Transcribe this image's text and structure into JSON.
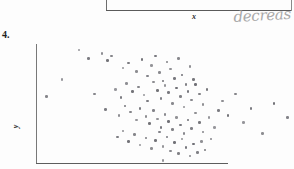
{
  "document": {
    "type": "scanned-worksheet",
    "background_color": "#fdfdfd"
  },
  "previous_figure": {
    "xlabel": "x",
    "axis_color": "#5a5a5a"
  },
  "annotation": {
    "text": "decreas",
    "style": "handwritten",
    "color": "#9a9a9a"
  },
  "question": {
    "number": "4."
  },
  "chart_data": {
    "type": "scatter",
    "title": "",
    "xlabel": "",
    "ylabel": "y",
    "xlim": [
      0,
      100
    ],
    "ylim": [
      0,
      100
    ],
    "grid": false,
    "legend": false,
    "point_color": "#6e6e74",
    "point_size": 2.6,
    "n_points": 103,
    "points": [
      [
        22,
        95
      ],
      [
        27,
        88
      ],
      [
        34,
        92
      ],
      [
        37,
        86
      ],
      [
        39,
        90
      ],
      [
        45,
        80
      ],
      [
        48,
        84
      ],
      [
        52,
        77
      ],
      [
        55,
        87
      ],
      [
        58,
        73
      ],
      [
        60,
        82
      ],
      [
        62,
        90
      ],
      [
        64,
        76
      ],
      [
        66,
        69
      ],
      [
        68,
        85
      ],
      [
        70,
        79
      ],
      [
        72,
        71
      ],
      [
        74,
        88
      ],
      [
        76,
        74
      ],
      [
        78,
        66
      ],
      [
        80,
        81
      ],
      [
        82,
        70
      ],
      [
        30,
        58
      ],
      [
        41,
        62
      ],
      [
        44,
        55
      ],
      [
        47,
        67
      ],
      [
        50,
        60
      ],
      [
        53,
        64
      ],
      [
        56,
        57
      ],
      [
        58,
        52
      ],
      [
        61,
        68
      ],
      [
        63,
        61
      ],
      [
        65,
        54
      ],
      [
        67,
        65
      ],
      [
        69,
        59
      ],
      [
        71,
        50
      ],
      [
        73,
        63
      ],
      [
        75,
        56
      ],
      [
        77,
        47
      ],
      [
        79,
        60
      ],
      [
        81,
        53
      ],
      [
        83,
        66
      ],
      [
        85,
        58
      ],
      [
        87,
        49
      ],
      [
        89,
        62
      ],
      [
        5,
        56
      ],
      [
        13,
        70
      ],
      [
        36,
        45
      ],
      [
        43,
        40
      ],
      [
        46,
        48
      ],
      [
        49,
        43
      ],
      [
        52,
        36
      ],
      [
        54,
        46
      ],
      [
        57,
        39
      ],
      [
        59,
        33
      ],
      [
        61,
        44
      ],
      [
        63,
        37
      ],
      [
        65,
        30
      ],
      [
        67,
        41
      ],
      [
        69,
        35
      ],
      [
        71,
        28
      ],
      [
        73,
        38
      ],
      [
        75,
        32
      ],
      [
        77,
        25
      ],
      [
        79,
        36
      ],
      [
        81,
        29
      ],
      [
        83,
        42
      ],
      [
        85,
        34
      ],
      [
        87,
        26
      ],
      [
        90,
        38
      ],
      [
        42,
        22
      ],
      [
        45,
        27
      ],
      [
        48,
        18
      ],
      [
        51,
        24
      ],
      [
        54,
        15
      ],
      [
        57,
        21
      ],
      [
        60,
        12
      ],
      [
        62,
        19
      ],
      [
        64,
        26
      ],
      [
        66,
        14
      ],
      [
        68,
        22
      ],
      [
        70,
        10
      ],
      [
        72,
        17
      ],
      [
        74,
        8
      ],
      [
        76,
        20
      ],
      [
        78,
        13
      ],
      [
        80,
        6
      ],
      [
        82,
        16
      ],
      [
        84,
        9
      ],
      [
        86,
        18
      ],
      [
        88,
        11
      ],
      [
        91,
        20
      ],
      [
        93,
        30
      ],
      [
        95,
        44
      ],
      [
        97,
        52
      ],
      [
        100,
        40
      ],
      [
        104,
        58
      ],
      [
        108,
        34
      ],
      [
        112,
        46
      ],
      [
        118,
        25
      ],
      [
        124,
        50
      ],
      [
        131,
        38
      ],
      [
        66,
        2
      ]
    ]
  }
}
